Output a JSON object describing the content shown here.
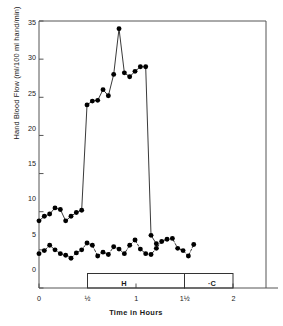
{
  "chart_data": {
    "type": "line",
    "title": "",
    "xlabel": "Time in Hours",
    "ylabel": "Hand Blood Flow  (ml/100 ml hand/min)",
    "xlim": [
      0,
      2.12
    ],
    "ylim": [
      0,
      35
    ],
    "grid": false,
    "legend": null,
    "xticks": [
      0,
      0.5,
      1,
      1.5,
      2
    ],
    "xtick_labels": [
      "0",
      "½",
      "1",
      "1½",
      "2"
    ],
    "yticks": [
      0,
      5,
      10,
      15,
      20,
      25,
      30,
      35
    ],
    "ytick_labels": [
      "0",
      "5",
      "10",
      "15",
      "20",
      "25",
      "30",
      "35"
    ],
    "series": [
      {
        "name": "hand-blood-flow-upper",
        "style": "solid",
        "marker": "filled-circle",
        "color": "#000000",
        "x": [
          0.0,
          0.055,
          0.11,
          0.165,
          0.22,
          0.275,
          0.33,
          0.385,
          0.44,
          0.495,
          0.55,
          0.605,
          0.66,
          0.715,
          0.77,
          0.825,
          0.88,
          0.935,
          0.99,
          1.045,
          1.1,
          1.155,
          1.21,
          1.265,
          1.32,
          1.375,
          1.43,
          1.485,
          1.54,
          1.595,
          1.65,
          1.705,
          1.76
        ],
        "y": [
          8.8,
          9.4,
          9.7,
          10.5,
          10.3,
          8.8,
          9.4,
          9.9,
          10.2,
          24.0,
          24.5,
          24.6,
          26.0,
          25.2,
          28.0,
          34.0,
          28.2,
          27.7,
          28.4,
          29.0,
          29.0,
          6.9,
          5.8,
          null,
          null,
          null,
          null,
          null,
          null,
          null,
          null,
          null,
          null
        ]
      },
      {
        "name": "hand-blood-flow-lower",
        "style": "dashed",
        "marker": "filled-circle",
        "color": "#000000",
        "x": [
          0.0,
          0.055,
          0.11,
          0.165,
          0.22,
          0.275,
          0.33,
          0.385,
          0.44,
          0.495,
          0.55,
          0.605,
          0.66,
          0.715,
          0.77,
          0.825,
          0.88,
          0.935,
          0.99,
          1.045,
          1.1,
          1.155,
          1.21,
          1.265,
          1.32,
          1.375,
          1.43,
          1.485,
          1.54,
          1.595,
          1.65,
          1.705,
          1.76
        ],
        "y": [
          4.5,
          4.9,
          5.6,
          5.0,
          4.5,
          4.3,
          3.9,
          4.6,
          5.0,
          5.9,
          5.6,
          4.2,
          4.7,
          4.4,
          5.4,
          5.1,
          4.5,
          5.6,
          6.3,
          5.1,
          4.5,
          4.4,
          5.2,
          6.1,
          6.4,
          6.5,
          5.2,
          4.9,
          4.2,
          5.7,
          null,
          null,
          null
        ]
      }
    ],
    "annotations": {
      "treatment_bar": {
        "segments": [
          {
            "label": "H",
            "x_start": 0.5,
            "x_end": 1.5
          },
          {
            "label": "·C",
            "x_start": 1.5,
            "x_end": 2.0
          }
        ]
      }
    }
  },
  "axes": {
    "ylabel": "Hand Blood Flow  (ml/100 ml hand/min)",
    "xlabel": "Time in Hours",
    "ytick_labels": [
      "35",
      "30",
      "25",
      "20",
      "15",
      "10",
      "5",
      "0"
    ],
    "xtick_labels": [
      "0",
      "½",
      "1",
      "1½",
      "2"
    ]
  },
  "bar": {
    "h_label": "H",
    "c_label": "·C"
  },
  "colors": {
    "ink": "#1a1a1a",
    "line": "#222222",
    "frame": "#555555",
    "background": "#ffffff"
  }
}
